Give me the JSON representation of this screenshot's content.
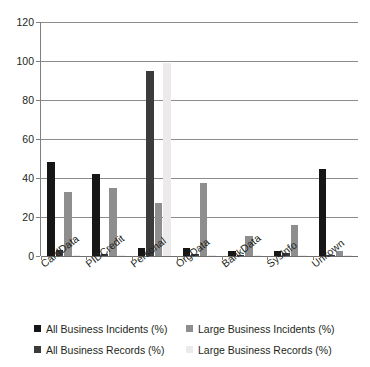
{
  "chart_data": {
    "type": "bar",
    "title": "",
    "subtitle": "",
    "xlabel": "",
    "ylabel": "",
    "ylim": [
      0,
      120
    ],
    "yticks": [
      0,
      20,
      40,
      60,
      80,
      100,
      120
    ],
    "grid": true,
    "legend_position": "bottom",
    "categories": [
      "CardData",
      "PIDCredit",
      "Personal",
      "OrgData",
      "BankData",
      "SysInfo",
      "Unkown"
    ],
    "series": [
      {
        "name": "All Business Incidents (%)",
        "color": "#161616",
        "values": [
          48,
          42,
          4,
          4,
          2.5,
          2.5,
          44.5
        ]
      },
      {
        "name": "All Business Records (%)",
        "color": "#3b3b3b",
        "values": [
          3,
          1,
          95,
          1,
          0.5,
          1.5,
          0.3
        ]
      },
      {
        "name": "Large Business Incidents (%)",
        "color": "#8e8e8e",
        "values": [
          33,
          35,
          27,
          37.5,
          10.5,
          16,
          2.5
        ]
      },
      {
        "name": "Large Business Records (%)",
        "color": "#eceaea",
        "values": [
          0.3,
          0.3,
          99,
          0.3,
          0.3,
          0.3,
          0.3
        ]
      }
    ]
  }
}
